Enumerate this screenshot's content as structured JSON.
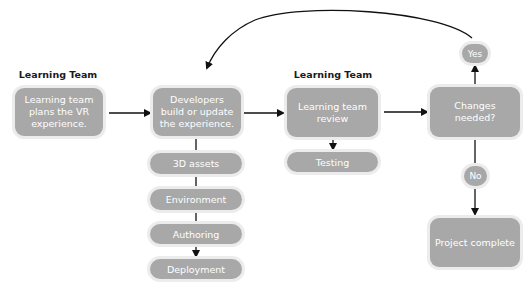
{
  "colors": {
    "node_fill": "#a8a8a8",
    "node_halo": "#ececec",
    "node_text": "#ffffff",
    "label_text": "#1a1a1a",
    "connector": "#111111"
  },
  "team_labels": [
    {
      "text": "Learning Team"
    },
    {
      "text": "Learning Team"
    }
  ],
  "nodes": {
    "plan": "Learning team plans the VR experience.",
    "build": "Developers build or update the experience.",
    "review": "Learning team review",
    "decision": "Changes needed?",
    "complete": "Project complete"
  },
  "build_steps": [
    {
      "label": "3D assets"
    },
    {
      "label": "Environment"
    },
    {
      "label": "Authoring"
    },
    {
      "label": "Deployment"
    }
  ],
  "review_step": {
    "label": "Testing"
  },
  "decision_branches": {
    "yes": "Yes",
    "no": "No"
  }
}
